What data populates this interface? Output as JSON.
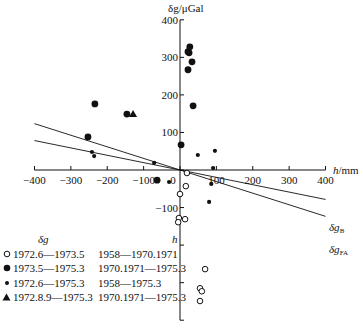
{
  "chart_data": {
    "type": "scatter",
    "title": "",
    "xlabel": "h/mm",
    "ylabel": "δg/μGal",
    "xlim": [
      -400,
      400
    ],
    "ylim": [
      -400,
      400
    ],
    "x_ticks": [
      -400,
      -300,
      -200,
      -100,
      0,
      100,
      200,
      300,
      400
    ],
    "y_ticks": [
      -400,
      -300,
      -200,
      -100,
      0,
      100,
      200,
      300,
      400
    ],
    "x_tick_labels": [
      "-400",
      "-300",
      "-200",
      "-100",
      "0",
      "100",
      "200",
      "300",
      "400"
    ],
    "y_tick_labels_shown": [
      "400",
      "300",
      "200",
      "100",
      "-100"
    ],
    "grid": false,
    "series": [
      {
        "name": "1972.6—1973.5 / 1958—1970.1971",
        "marker": "open-circle",
        "points": [
          [
            19,
            -8
          ],
          [
            16,
            -43
          ],
          [
            0,
            -64
          ],
          [
            -3,
            -128
          ],
          [
            -5,
            -139
          ],
          [
            14,
            -131
          ],
          [
            69,
            -264
          ],
          [
            55,
            -315
          ],
          [
            60,
            -323
          ],
          [
            55,
            -349
          ]
        ]
      },
      {
        "name": "1973.5—1975.3 / 1970.1971—1975.3",
        "marker": "large-filled-circle",
        "points": [
          [
            -234,
            176
          ],
          [
            -253,
            88
          ],
          [
            -146,
            149
          ],
          [
            3,
            67
          ],
          [
            36,
            171
          ],
          [
            22,
            315
          ],
          [
            27,
            328
          ],
          [
            25,
            312
          ],
          [
            33,
            288
          ],
          [
            22,
            267
          ],
          [
            -63,
            -27
          ]
        ]
      },
      {
        "name": "1972.6—1975.3 / 1958—1975.3",
        "marker": "small-filled-circle",
        "points": [
          [
            -242,
            48
          ],
          [
            -236,
            37
          ],
          [
            -71,
            19
          ],
          [
            49,
            40
          ],
          [
            96,
            51
          ],
          [
            91,
            5
          ],
          [
            86,
            -37
          ],
          [
            80,
            -85
          ],
          [
            -30,
            -32
          ]
        ]
      },
      {
        "name": "1972.8.9—1975.3 / 1970.1971—1975.3",
        "marker": "filled-triangle",
        "points": [
          [
            -129,
            149
          ]
        ]
      }
    ],
    "lines": [
      {
        "name": "δg_B",
        "label": "δgB",
        "slope": -0.196,
        "x_range": [
          -400,
          400
        ]
      },
      {
        "name": "δg_FA",
        "label": "δgFA",
        "slope": -0.3086,
        "x_range": [
          -400,
          400
        ]
      }
    ],
    "legend": {
      "position": "lower-left",
      "headers": [
        "δg",
        "h"
      ],
      "entries": [
        {
          "symbol": "open-circle",
          "dg": "1972.6—1973.5",
          "h": "1958—1970.1971"
        },
        {
          "symbol": "large-filled-circle",
          "dg": "1973.5—1975.3",
          "h": "1970.1971—1975.3"
        },
        {
          "symbol": "small-filled-circle",
          "dg": "1972.6—1975.3",
          "h": "1958—1975.3"
        },
        {
          "symbol": "filled-triangle",
          "dg": "1972.8.9—1975.3",
          "h": "1970.1971—1975.3"
        }
      ]
    }
  },
  "axes": {
    "y_title": "δg/μGal",
    "x_title_italic": "h",
    "x_title_unit": "/mm"
  },
  "line_labels": {
    "b_main": "δg",
    "b_sub": "B",
    "fa_main": "δg",
    "fa_sub": "FA"
  }
}
